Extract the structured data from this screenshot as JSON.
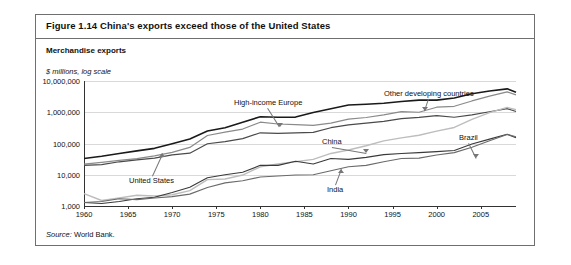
{
  "figure": {
    "title": "Figure 1.14  China's exports exceed those of the United States",
    "subtitle": "Merchandise exports",
    "axis_note": "$ millions, log scale",
    "source_label": "Source:",
    "source_text": " World Bank."
  },
  "chart_data": {
    "type": "line",
    "title": "China's exports exceed those of the United States",
    "subtitle": "Merchandise exports",
    "xlabel": "",
    "ylabel": "$ millions, log scale",
    "yscale": "log",
    "ylim": [
      1000,
      10000000
    ],
    "ytick_labels": [
      "10,000,000",
      "1,000,000",
      "100,000",
      "10,000",
      "1,000"
    ],
    "ytick_values": [
      10000000,
      1000000,
      100000,
      10000,
      1000
    ],
    "xlim": [
      1960,
      2009
    ],
    "xtick_labels": [
      "1960",
      "1965",
      "1970",
      "1975",
      "1980",
      "1985",
      "1990",
      "1995",
      "2000",
      "2005"
    ],
    "xtick_values": [
      1960,
      1965,
      1970,
      1975,
      1980,
      1985,
      1990,
      1995,
      2000,
      2005
    ],
    "grid": true,
    "legend": "inline-annotations",
    "x": [
      1960,
      1962,
      1964,
      1966,
      1968,
      1970,
      1972,
      1974,
      1976,
      1978,
      1980,
      1982,
      1984,
      1986,
      1988,
      1990,
      1992,
      1994,
      1996,
      1998,
      2000,
      2002,
      2004,
      2006,
      2008,
      2009
    ],
    "series": [
      {
        "name": "High-income Europe",
        "color": "#1a1a1a",
        "width": 1.6,
        "values": [
          33000,
          39000,
          48000,
          58000,
          70000,
          98000,
          140000,
          250000,
          320000,
          480000,
          720000,
          690000,
          700000,
          980000,
          1300000,
          1700000,
          1800000,
          1950000,
          2200000,
          2450000,
          2450000,
          2850000,
          3900000,
          4800000,
          5600000,
          4400000
        ]
      },
      {
        "name": "Other developing countries",
        "color": "#8a8a8a",
        "width": 1.2,
        "values": [
          22000,
          25000,
          29000,
          33000,
          40000,
          52000,
          75000,
          180000,
          230000,
          290000,
          480000,
          420000,
          400000,
          380000,
          450000,
          600000,
          680000,
          820000,
          1050000,
          1000000,
          1450000,
          1550000,
          2300000,
          3300000,
          4500000,
          3600000
        ]
      },
      {
        "name": "United States",
        "color": "#4a4a4a",
        "width": 1.2,
        "values": [
          20000,
          21000,
          26000,
          30000,
          34000,
          43000,
          49000,
          98000,
          115000,
          143000,
          220000,
          212000,
          218000,
          227000,
          320000,
          393000,
          448000,
          513000,
          625000,
          683000,
          782000,
          693000,
          819000,
          1038000,
          1300000,
          1057000
        ]
      },
      {
        "name": "China",
        "color": "#bdbdbd",
        "width": 1.4,
        "values": [
          2500,
          1500,
          1800,
          2200,
          2100,
          2300,
          3100,
          7000,
          7300,
          9800,
          18000,
          22000,
          26000,
          31000,
          48000,
          62000,
          85000,
          121000,
          151000,
          184000,
          249000,
          326000,
          593000,
          969000,
          1430000,
          1202000
        ]
      },
      {
        "name": "Brazil",
        "color": "#3a3a3a",
        "width": 1.1,
        "values": [
          1300,
          1200,
          1400,
          1700,
          1900,
          2700,
          4000,
          8000,
          10000,
          12000,
          20000,
          20000,
          27000,
          22000,
          33000,
          31000,
          36000,
          44000,
          48000,
          51000,
          55000,
          60000,
          96000,
          138000,
          198000,
          153000
        ]
      },
      {
        "name": "India",
        "color": "#6a6a6a",
        "width": 1.1,
        "values": [
          1300,
          1400,
          1700,
          1600,
          1800,
          2000,
          2400,
          3900,
          5500,
          6400,
          8500,
          9100,
          9800,
          10000,
          13500,
          18000,
          20000,
          26000,
          33000,
          34000,
          43000,
          51000,
          76000,
          122000,
          195000,
          165000
        ]
      }
    ],
    "annotations": [
      {
        "label": "High-income Europe",
        "x": 1981,
        "series": "High-income Europe"
      },
      {
        "label": "Other developing countries",
        "x": 2002,
        "series": "Other developing countries"
      },
      {
        "label": "China",
        "x": 1995,
        "series": "China"
      },
      {
        "label": "Brazil",
        "x": 2006,
        "series": "Brazil"
      },
      {
        "label": "United States",
        "x": 1968,
        "series": "United States"
      },
      {
        "label": "India",
        "x": 1996,
        "series": "India"
      }
    ]
  }
}
